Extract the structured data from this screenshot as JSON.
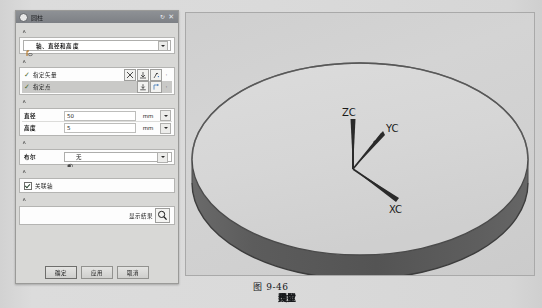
{
  "dialog": {
    "title": "圆柱",
    "title_icon": "cylinder-icon",
    "reset_icon": "reset-icon",
    "close_icon": "close-icon",
    "sections": {
      "type": {
        "header": "类型",
        "collapse_glyph": "∧",
        "value": "轴、直径和高度",
        "value_icon": "axis-diameter-height-icon",
        "dropdown_glyph": "▾"
      },
      "axis": {
        "header": "轴",
        "collapse_glyph": "∧",
        "rows": [
          {
            "check": "✓",
            "label": "指定矢量",
            "tools": [
              "vector-cross-icon",
              "vector-snap-icon",
              "vector-constructor-icon",
              "·"
            ]
          },
          {
            "check": "✓",
            "label": "指定点",
            "tools": [
              "point-snap-icon",
              "point-constructor-icon",
              "·"
            ]
          }
        ]
      },
      "dimensions": {
        "header": "尺寸",
        "collapse_glyph": "∧",
        "rows": [
          {
            "name": "直径",
            "value": "50",
            "unit": "mm",
            "dropdown_glyph": "▾"
          },
          {
            "name": "高度",
            "value": "5",
            "unit": "mm",
            "dropdown_glyph": "▾"
          }
        ]
      },
      "boolean": {
        "header": "布尔",
        "collapse_glyph": "∧",
        "label": "布尔",
        "value": "无",
        "value_icon": "boolean-none-icon",
        "dropdown_glyph": "▾"
      },
      "settings": {
        "header": "设置",
        "collapse_glyph": "∧",
        "checkbox_label": "关联轴",
        "checkbox_checked": true
      },
      "preview": {
        "header": "预览",
        "collapse_glyph": "∧",
        "show_result_label": "显示结果",
        "show_result_icon": "magnifier-icon"
      }
    },
    "buttons": {
      "ok": "确定",
      "apply": "应用",
      "cancel": "取消"
    }
  },
  "viewport": {
    "name": "cad-3d-viewport",
    "model": "disc-cylinder",
    "triad": {
      "z_label": "ZC",
      "y_label": "YC",
      "x_label": "XC"
    },
    "colors": {
      "background": "#d2d2d2",
      "top_face": "#d6d6d6",
      "side_wall": "#5a5a5a",
      "edge": "#3a3a3a"
    }
  },
  "caption": "图 9-46"
}
